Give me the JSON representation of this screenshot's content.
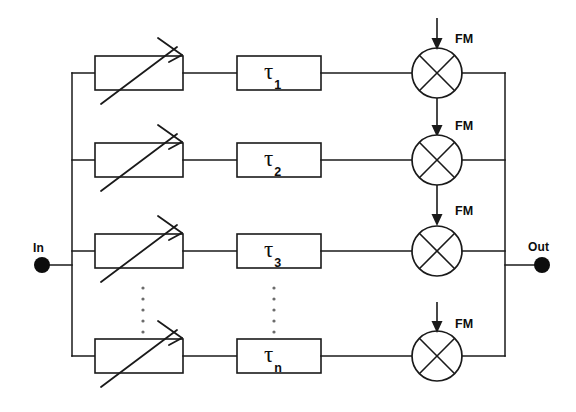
{
  "figure": {
    "type": "block-diagram",
    "background_color": "#ffffff",
    "line_color": "#1a1a1a"
  },
  "ports": {
    "input": {
      "label": "In",
      "x": 38,
      "y": 265
    },
    "output": {
      "label": "Out",
      "x": 538,
      "y": 265
    }
  },
  "buses": {
    "left_rail_x": 72,
    "right_rail_x": 505,
    "input_stub_x_from": 50,
    "input_stub_x_to": 72,
    "output_stub_x_from": 505,
    "output_stub_x_to": 536
  },
  "branches": [
    {
      "index": 1,
      "y": 73,
      "attenuator": {
        "name": "variable-attenuator",
        "x": 95,
        "width": 88,
        "height": 34
      },
      "delay": {
        "label": "τ",
        "subscript": "1",
        "x": 237,
        "width": 84,
        "height": 34
      },
      "mixer": {
        "name": "mixer",
        "cx": 437,
        "r": 25
      },
      "fm_label": "FM",
      "fm_source": "external"
    },
    {
      "index": 2,
      "y": 160,
      "attenuator": {
        "name": "variable-attenuator",
        "x": 95,
        "width": 88,
        "height": 34
      },
      "delay": {
        "label": "τ",
        "subscript": "2",
        "x": 237,
        "width": 84,
        "height": 34
      },
      "mixer": {
        "name": "mixer",
        "cx": 437,
        "r": 25
      },
      "fm_label": "FM",
      "fm_source": "chained"
    },
    {
      "index": 3,
      "y": 251,
      "attenuator": {
        "name": "variable-attenuator",
        "x": 95,
        "width": 88,
        "height": 34
      },
      "delay": {
        "label": "τ",
        "subscript": "3",
        "x": 237,
        "width": 84,
        "height": 34
      },
      "mixer": {
        "name": "mixer",
        "cx": 437,
        "r": 25
      },
      "fm_label": "FM",
      "fm_source": "chained"
    },
    {
      "index": 4,
      "y": 356,
      "attenuator": {
        "name": "variable-attenuator",
        "x": 95,
        "width": 88,
        "height": 34
      },
      "delay": {
        "label": "τ",
        "subscript": "n",
        "x": 237,
        "width": 84,
        "height": 34
      },
      "mixer": {
        "name": "mixer",
        "cx": 437,
        "r": 25
      },
      "fm_label": "FM",
      "fm_source": "external"
    }
  ],
  "fm_labels": [
    {
      "text": "FM",
      "x": 455,
      "y": 33
    },
    {
      "text": "FM",
      "x": 455,
      "y": 120
    },
    {
      "text": "FM",
      "x": 455,
      "y": 205
    },
    {
      "text": "FM",
      "x": 455,
      "y": 318
    }
  ],
  "ellipses": [
    {
      "name": "attenuator-column-ellipsis",
      "x": 143,
      "y_start": 288,
      "count": 5,
      "spacing": 11
    },
    {
      "name": "delay-column-ellipsis",
      "x": 274,
      "y_start": 288,
      "count": 5,
      "spacing": 11
    }
  ],
  "tau_labels": [
    "τ 1",
    "τ 2",
    "τ 3",
    "τ n"
  ]
}
